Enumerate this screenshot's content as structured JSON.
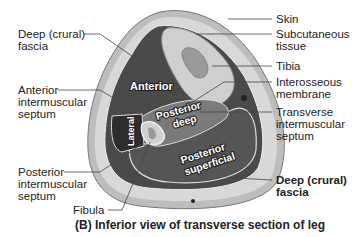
{
  "figure": {
    "caption": "(B) Inferior view of transverse section of leg",
    "labels_left": [
      {
        "id": "deep-crural-fascia-left",
        "lines": [
          "Deep (crural)",
          "fascia"
        ]
      },
      {
        "id": "anterior-intermuscular-septum",
        "lines": [
          "Anterior",
          "intermuscular",
          "septum"
        ]
      },
      {
        "id": "posterior-intermuscular-septum",
        "lines": [
          "Posterior",
          "intermuscular",
          "septum"
        ]
      },
      {
        "id": "fibula",
        "lines": [
          "Fibula"
        ]
      }
    ],
    "labels_right": [
      {
        "id": "skin",
        "lines": [
          "Skin"
        ]
      },
      {
        "id": "subcutaneous-tissue",
        "lines": [
          "Subcutaneous",
          "tissue"
        ]
      },
      {
        "id": "tibia",
        "lines": [
          "Tibia"
        ]
      },
      {
        "id": "interosseous-membrane",
        "lines": [
          "Interosseous",
          "membrane"
        ]
      },
      {
        "id": "transverse-intermuscular-septum",
        "lines": [
          "Transverse",
          "intermuscular",
          "septum"
        ]
      },
      {
        "id": "deep-crural-fascia-right",
        "lines": [
          "Deep (crural)",
          "fascia"
        ],
        "bold": true
      }
    ],
    "compartments": {
      "anterior": "Anterior",
      "lateral": "Lateral",
      "posterior_deep": [
        "Posterior",
        "deep"
      ],
      "posterior_superficial": [
        "Posterior",
        "superficial"
      ]
    },
    "colors": {
      "skin": "#bdbdbd",
      "subcutaneous": "#d6d6d6",
      "muscle_dark": "#4a4a4a",
      "lateral": "#2e2e2e",
      "posterior_deep": "#7a7a7a",
      "posterior_superficial": "#555555",
      "bone": "#cfcfcf",
      "marrow": "#9a9a9a"
    }
  }
}
